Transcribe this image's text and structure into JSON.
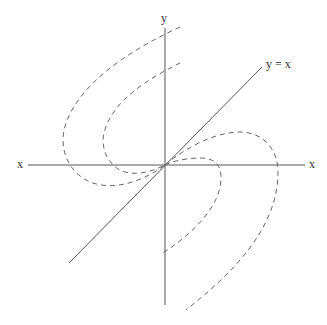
{
  "diagram": {
    "title": "",
    "labels": {
      "y_axis": "y",
      "x_axis_left": "x",
      "x_axis_right": "x",
      "diagonal": "y = x"
    },
    "colors": {
      "axis": "#555555",
      "curve": "#666666",
      "text": "#333333",
      "background": "#ffffff"
    },
    "elements": [
      {
        "type": "axis",
        "name": "x-axis",
        "style": "solid"
      },
      {
        "type": "axis",
        "name": "y-axis",
        "style": "solid"
      },
      {
        "type": "line",
        "name": "y = x",
        "style": "solid"
      },
      {
        "type": "curve",
        "name": "outer trajectory",
        "style": "dashed",
        "count": 2
      },
      {
        "type": "curve",
        "name": "inner trajectory",
        "style": "dashed",
        "count": 2
      }
    ]
  }
}
